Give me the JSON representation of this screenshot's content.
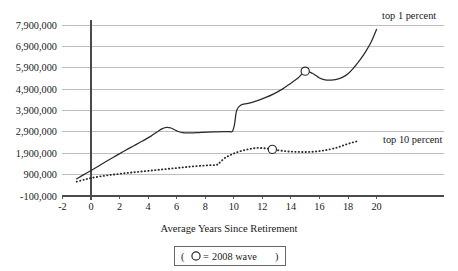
{
  "chart_data": {
    "type": "line",
    "title": "",
    "xlabel": "Average Years Since Retirement",
    "ylabel": "",
    "xlim": [
      -2.6,
      21.2
    ],
    "ylim": [
      -100000,
      7900000
    ],
    "grid": true,
    "legend_position": "inline-right",
    "xticks": [
      -2,
      0,
      2,
      4,
      6,
      8,
      10,
      12,
      14,
      16,
      18,
      20
    ],
    "xtick_labels": [
      "-2",
      "0",
      "2",
      "4",
      "6",
      "8",
      "10",
      "12",
      "14",
      "16",
      "18",
      "20"
    ],
    "yticks": [
      -100000,
      900000,
      1900000,
      2900000,
      3900000,
      4900000,
      5900000,
      6900000,
      7900000
    ],
    "ytick_labels": [
      "-100,000",
      "900,000",
      "1,900,000",
      "2,900,000",
      "3,900,000",
      "4,900,000",
      "5,900,000",
      "6,900,000",
      "7,900,000"
    ],
    "series": [
      {
        "name": "top 1 percent",
        "style": "solid",
        "annotation": "top 1 percent",
        "marker_label": "2008 wave",
        "marker_point": {
          "x": 15.0,
          "y": 5740000
        },
        "x": [
          -1.0,
          -0.5,
          0.0,
          0.6,
          1.2,
          1.8,
          2.4,
          3.0,
          3.6,
          4.2,
          4.7,
          5.0,
          5.3,
          5.6,
          6.0,
          6.4,
          7.0,
          7.6,
          8.2,
          8.8,
          9.3,
          9.7,
          9.9,
          10.05,
          10.2,
          10.5,
          11.0,
          11.6,
          12.2,
          12.8,
          13.4,
          14.0,
          14.5,
          15.0,
          15.5,
          16.0,
          16.4,
          16.8,
          17.2,
          17.6,
          18.0,
          18.4,
          18.8,
          19.2,
          19.6,
          20.0
        ],
        "y": [
          700000,
          900000,
          1090000,
          1330000,
          1570000,
          1800000,
          2030000,
          2250000,
          2470000,
          2700000,
          2930000,
          3050000,
          3110000,
          3080000,
          2950000,
          2860000,
          2850000,
          2870000,
          2890000,
          2900000,
          2910000,
          2915000,
          2920000,
          3250000,
          3900000,
          4160000,
          4230000,
          4350000,
          4500000,
          4680000,
          4900000,
          5180000,
          5420000,
          5740000,
          5640000,
          5420000,
          5330000,
          5320000,
          5360000,
          5450000,
          5620000,
          5900000,
          6230000,
          6620000,
          7080000,
          7700000
        ]
      },
      {
        "name": "top 10 percent",
        "style": "dotted",
        "annotation": "top 10 percent",
        "marker_label": "2008 wave",
        "marker_point": {
          "x": 12.7,
          "y": 2080000
        },
        "x": [
          -1.0,
          -0.5,
          0.0,
          0.6,
          1.2,
          1.8,
          2.4,
          3.0,
          3.6,
          4.2,
          4.8,
          5.4,
          6.0,
          6.6,
          7.2,
          7.8,
          8.3,
          8.7,
          8.9,
          9.1,
          9.4,
          9.8,
          10.2,
          10.7,
          11.2,
          11.7,
          12.2,
          12.7,
          13.2,
          13.7,
          14.2,
          14.7,
          15.2,
          15.7,
          16.2,
          16.7,
          17.2,
          17.6,
          18.0,
          18.4,
          18.7
        ],
        "y": [
          570000,
          660000,
          740000,
          810000,
          870000,
          920000,
          970000,
          1010000,
          1050000,
          1090000,
          1130000,
          1170000,
          1210000,
          1250000,
          1290000,
          1320000,
          1340000,
          1350000,
          1390000,
          1520000,
          1690000,
          1830000,
          1940000,
          2040000,
          2110000,
          2150000,
          2130000,
          2080000,
          2030000,
          1990000,
          1970000,
          1960000,
          1960000,
          1980000,
          2020000,
          2080000,
          2160000,
          2250000,
          2340000,
          2420000,
          2470000
        ]
      }
    ],
    "legend": {
      "marker_symbol": "circle-open",
      "prefix": "(",
      "equals": "=",
      "label": "2008 wave",
      "suffix": ")"
    }
  }
}
